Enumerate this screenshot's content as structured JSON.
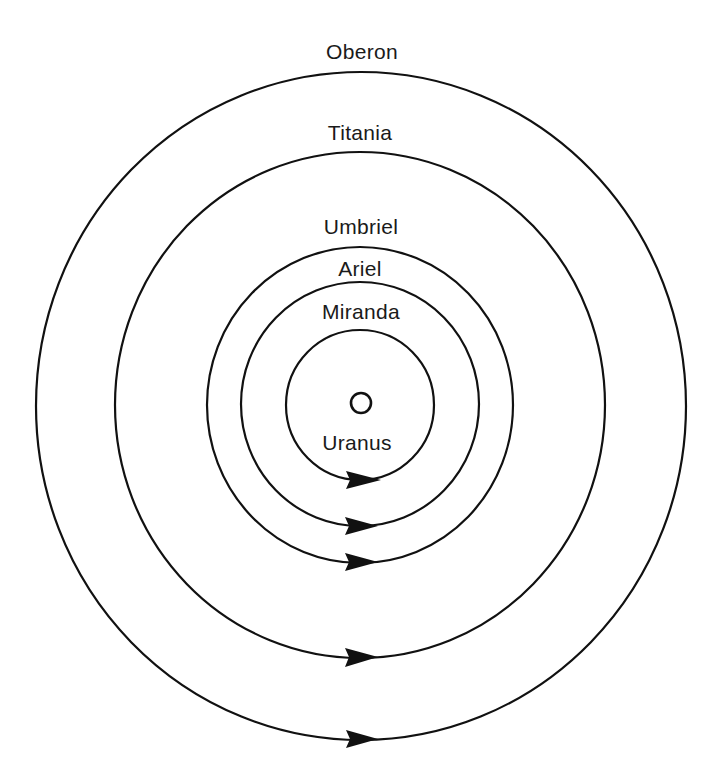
{
  "diagram": {
    "planet": {
      "label": "Uranus",
      "cx": 361,
      "cy": 403,
      "r": 10
    },
    "moons": [
      {
        "label": "Miranda",
        "cx": 360,
        "cy": 405,
        "rx": 74,
        "ry": 75,
        "arrow_y": 480
      },
      {
        "label": "Ariel",
        "cx": 360,
        "cy": 405,
        "rx": 119,
        "ry": 122,
        "arrow_y": 527
      },
      {
        "label": "Umbriel",
        "cx": 360,
        "cy": 405,
        "rx": 153,
        "ry": 158,
        "arrow_y": 563
      },
      {
        "label": "Titania",
        "cx": 360,
        "cy": 405,
        "rx": 245,
        "ry": 253,
        "arrow_y": 658
      },
      {
        "label": "Oberon",
        "cx": 361,
        "cy": 406,
        "rx": 325,
        "ry": 334,
        "arrow_y": 740
      }
    ],
    "labels": {
      "oberon": "Oberon",
      "titania": "Titania",
      "umbriel": "Umbriel",
      "ariel": "Ariel",
      "miranda": "Miranda",
      "uranus": "Uranus"
    },
    "orbit_direction": "counterclockwise (arrows point right at bottom of each orbit)",
    "colors": {
      "stroke": "#111111",
      "background": "#ffffff"
    }
  }
}
